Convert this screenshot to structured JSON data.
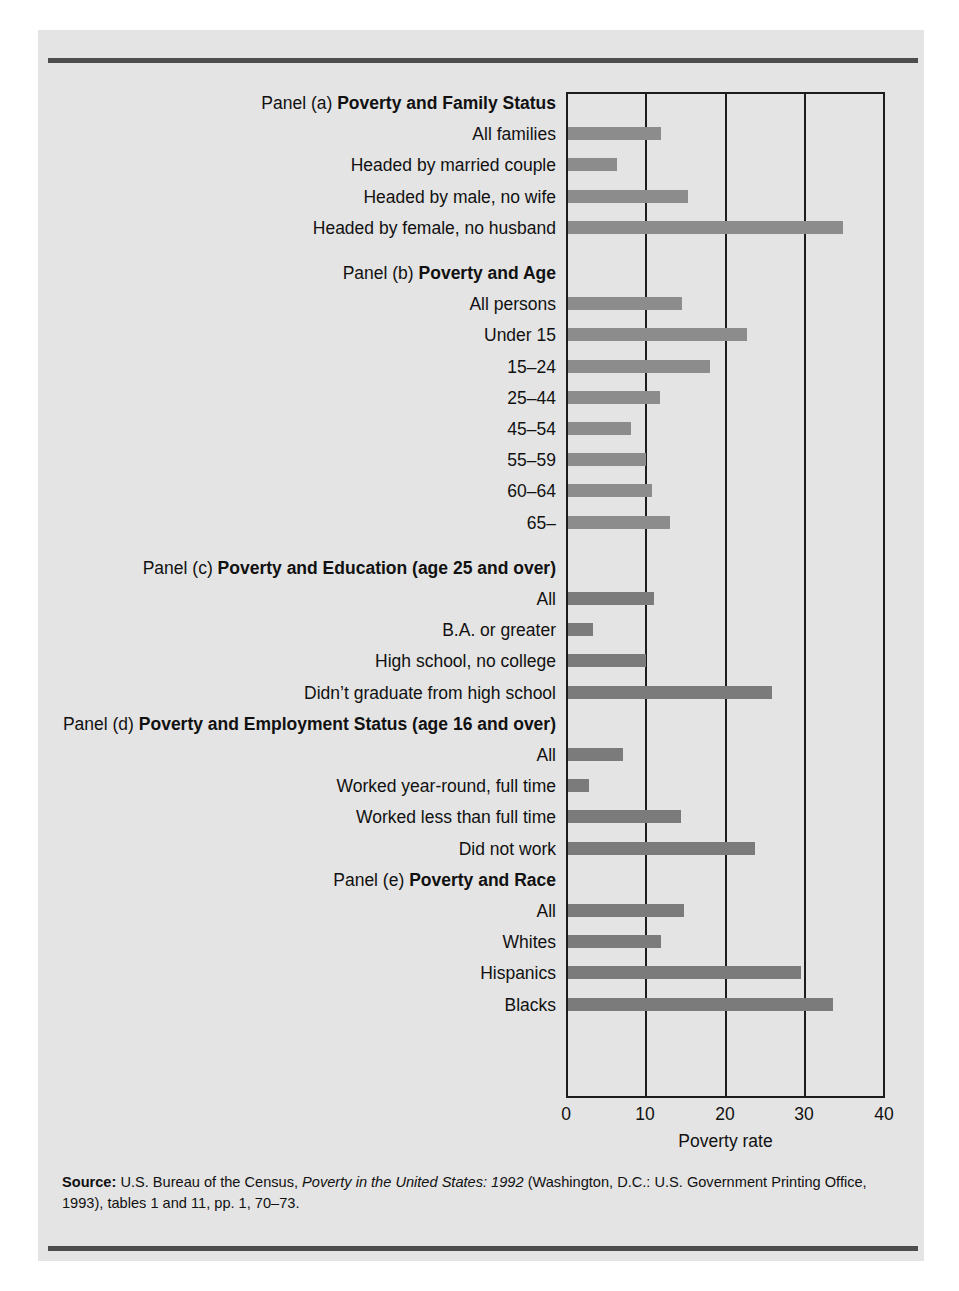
{
  "figure": {
    "x_axis_title": "Poverty rate",
    "source_prefix": "Source:",
    "source_part1": " U.S. Bureau of the Census, ",
    "source_italic": "Poverty in the United States: 1992",
    "source_part2": " (Washington, D.C.: U.S. Government Printing Office, 1993), tables 1 and 11, pp. 1, 70–73."
  },
  "chart_data": {
    "type": "bar",
    "orientation": "horizontal",
    "title": "",
    "xlabel": "Poverty rate",
    "ylabel": "",
    "xlim": [
      0,
      40
    ],
    "xticks": [
      0,
      10,
      20,
      30,
      40
    ],
    "xtick_labels": [
      "0",
      "10",
      "20",
      "30",
      "40"
    ],
    "grid": "vertical gridlines at 10, 20, 30",
    "legend": "none",
    "bar_color": "#8c8c8c",
    "panels": [
      {
        "id": "a",
        "lead": "Panel (a) ",
        "title": "Poverty and Family Status",
        "categories": [
          "All families",
          "Headed by married couple",
          "Headed by male, no wife",
          "Headed by female, no husband"
        ],
        "values": [
          11.7,
          6.2,
          15.1,
          34.7
        ]
      },
      {
        "id": "b",
        "lead": "Panel (b) ",
        "title": "Poverty and Age",
        "categories": [
          "All persons",
          "Under 15",
          "15–24",
          "25–44",
          "45–54",
          "55–59",
          "60–64",
          "65–"
        ],
        "values": [
          14.4,
          22.6,
          17.9,
          11.6,
          8.0,
          9.9,
          10.6,
          12.9
        ]
      },
      {
        "id": "c",
        "lead": "Panel (c) ",
        "title": "Poverty and Education (age 25 and over)",
        "categories": [
          "All",
          "B.A. or greater",
          "High school, no college",
          "Didn’t graduate from high school"
        ],
        "values": [
          10.9,
          3.1,
          9.8,
          25.8
        ]
      },
      {
        "id": "d",
        "lead": "Panel (d) ",
        "title": "Poverty and Employment Status (age 16 and over)",
        "categories": [
          "All",
          "Worked year-round, full time",
          "Worked less than full time",
          "Did not work"
        ],
        "values": [
          7.0,
          2.6,
          14.2,
          23.6
        ]
      },
      {
        "id": "e",
        "lead": "Panel (e) ",
        "title": "Poverty and Race",
        "categories": [
          "All",
          "Whites",
          "Hispanics",
          "Blacks"
        ],
        "values": [
          14.6,
          11.7,
          29.4,
          33.5
        ]
      }
    ]
  }
}
